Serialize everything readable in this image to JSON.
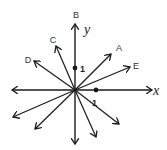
{
  "diagram": {
    "type": "vector-diagram",
    "origin": [
      75,
      90
    ],
    "axes": {
      "x_label": "x",
      "y_label": "y"
    },
    "unit_marks": {
      "x_unit_label": "1",
      "y_unit_label": "1"
    },
    "vector_labels": {
      "A": "A",
      "B": "B",
      "C": "C",
      "D": "D",
      "E": "E"
    },
    "colors": {
      "stroke": "#1a1a1a",
      "background": "#ffffff"
    }
  }
}
